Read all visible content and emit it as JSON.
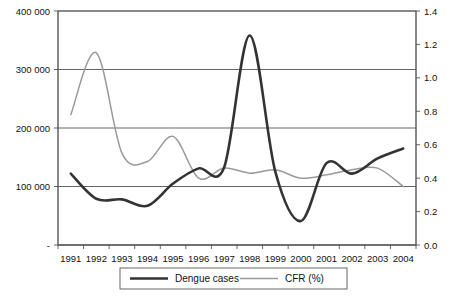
{
  "chart_data": {
    "type": "line",
    "title": "",
    "subtitle": "",
    "xlabel": "",
    "ylabel": "",
    "grid": true,
    "legend_position": "bottom",
    "categories": [
      "1991",
      "1992",
      "1993",
      "1994",
      "1995",
      "1996",
      "1997",
      "1998",
      "1999",
      "2000",
      "2001",
      "2002",
      "2003",
      "2004"
    ],
    "axes": {
      "left": {
        "label": "",
        "ylim": [
          0,
          400000
        ],
        "ticks": [
          0,
          100000,
          200000,
          300000,
          400000
        ],
        "ticklabels": [
          "-",
          "100 000",
          "200 000",
          "300 000",
          "400 000"
        ],
        "series_ref": "Dengue cases"
      },
      "right": {
        "label": "",
        "ylim": [
          0.0,
          1.4
        ],
        "ticks": [
          0.0,
          0.2,
          0.4,
          0.6,
          0.8,
          1.0,
          1.2,
          1.4
        ],
        "ticklabels": [
          "0.0",
          "0.2",
          "0.4",
          "0.6",
          "0.8",
          "1.0",
          "1.2",
          "1.4"
        ],
        "series_ref": "CFR (%)"
      }
    },
    "series": [
      {
        "name": "Dengue cases",
        "axis": "left",
        "color": "#333333",
        "width": 2.6,
        "values": [
          122000,
          79000,
          78000,
          67000,
          105000,
          131000,
          133000,
          358000,
          125000,
          41000,
          140000,
          122000,
          148000,
          165000
        ]
      },
      {
        "name": "CFR (%)",
        "axis": "right",
        "color": "#9a9a9a",
        "width": 1.5,
        "values": [
          0.78,
          1.15,
          0.55,
          0.5,
          0.65,
          0.4,
          0.46,
          0.43,
          0.45,
          0.4,
          0.42,
          0.45,
          0.46,
          0.35
        ]
      }
    ]
  },
  "legend": {
    "items": [
      {
        "label": "Dengue cases",
        "color": "#333333",
        "width": 2.6
      },
      {
        "label": "CFR (%)",
        "color": "#9a9a9a",
        "width": 1.5
      }
    ]
  },
  "plot_geometry": {
    "left": 58,
    "right": 416,
    "top": 11,
    "bottom": 245
  }
}
